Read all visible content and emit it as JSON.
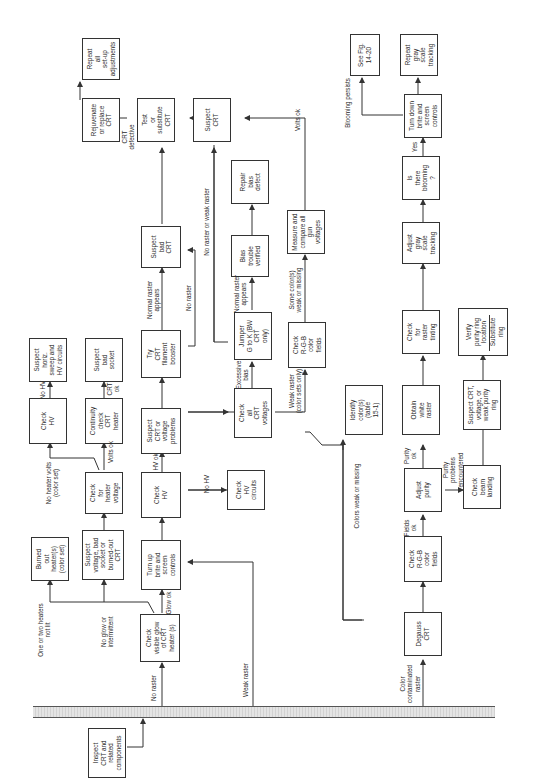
{
  "diagram": {
    "orientation": "rotated 90 degrees counter-clockwise",
    "start": {
      "id": "inspect",
      "label": "Inspect\nCRT and\nrelated\ncomponents"
    },
    "boxes": [
      {
        "id": "inspect",
        "label": "Inspect\nCRT and\nrelated\ncomponents"
      },
      {
        "id": "check_glow",
        "label": "Check\nvisible glow\nof CRT\nheater (s)"
      },
      {
        "id": "burned_out",
        "label": "Burned\nout\nheater(s)\n(color set)"
      },
      {
        "id": "suspect_voltage",
        "label": "Suspect\nvoltage, bad\nsocket or\nburned-out\nCRT"
      },
      {
        "id": "turn_up",
        "label": "Turn up\nbrite and\nscreen\ncontrols"
      },
      {
        "id": "check_heater_voltage",
        "label": "Check\nfor\nheater\nvoltage"
      },
      {
        "id": "check_hv_1",
        "label": "Check\nHV"
      },
      {
        "id": "suspect_horiz",
        "label": "Suspect\nhoriz.\nsweep and\nHV circuits"
      },
      {
        "id": "continuity",
        "label": "Continuity\ncheck\nCRT\nheater"
      },
      {
        "id": "suspect_socket",
        "label": "Suspect\nbad\nsocket"
      },
      {
        "id": "check_hv_2",
        "label": "Check\nHV"
      },
      {
        "id": "check_hv_circuits",
        "label": "Check\nHV\ncircuits"
      },
      {
        "id": "suspect_crt_voltage",
        "label": "Suspect\nCRT or\nvoltage\nproblems"
      },
      {
        "id": "try_booster",
        "label": "Try\nCRT\nfilament\nbooster"
      },
      {
        "id": "suspect_bad_crt",
        "label": "Suspect\nbad\nCRT"
      },
      {
        "id": "test_substitute",
        "label": "Test\nor\nsubstitute\nCRT"
      },
      {
        "id": "rejuvenate",
        "label": "Rejuvenate\nor replace\nCRT"
      },
      {
        "id": "repeat_setup",
        "label": "Repeat\nall\nset-up\nadjustments"
      },
      {
        "id": "check_all_crt",
        "label": "Check\nall\nCRT\nvoltages"
      },
      {
        "id": "jumper",
        "label": "Jumper\nG to K (BW\nCRT\nonly)"
      },
      {
        "id": "bias_verified",
        "label": "Bias\ntrouble\nverified"
      },
      {
        "id": "repair_bias",
        "label": "Repair\nbias\ndefect"
      },
      {
        "id": "check_rgb_1",
        "label": "Check\nR-G-B\ncolor\nfields"
      },
      {
        "id": "measure_gun",
        "label": "Measure and\ncompare all\ngun\nvoltages"
      },
      {
        "id": "suspect_crt",
        "label": "Suspect\nCRT"
      },
      {
        "id": "degauss",
        "label": "Degauss\nCRT"
      },
      {
        "id": "check_rgb_2",
        "label": "Check\nR-G-B\ncolor\nfields"
      },
      {
        "id": "identify_colors",
        "label": "Identify\ncolor(s)\n(table\n15-1)"
      },
      {
        "id": "adjust_purity",
        "label": "Adjust\npurity"
      },
      {
        "id": "obtain_white",
        "label": "Obtain\nwhite\nraster"
      },
      {
        "id": "check_tinting",
        "label": "Check\nfor\nraster\ntinting"
      },
      {
        "id": "adjust_gray",
        "label": "Adjust\ngray\nscale\ntracking"
      },
      {
        "id": "is_blooming",
        "label": "Is\nthere\nblooming\n?"
      },
      {
        "id": "turn_down",
        "label": "Turn down\nbrite and\nscreen\ncontrols"
      },
      {
        "id": "see_fig",
        "label": "See Fig.\n14-20"
      },
      {
        "id": "repeat_gray",
        "label": "Repeat\ngray\nscale\ntracking"
      },
      {
        "id": "check_beam",
        "label": "Check\nbeam\nlanding"
      },
      {
        "id": "suspect_purity_ring",
        "label": "Suspect CRT,\nvoltage, or\nweak purity\nring"
      },
      {
        "id": "verify_ring",
        "label": "Verify\npurity ring\nlocation"
      },
      {
        "id": "substitute_ring",
        "label": "Substitute\nring"
      }
    ],
    "labels": {
      "no_raster": "No raster",
      "weak_raster": "Weak raster",
      "color_contaminated": "Color\ncontaminated\nraster",
      "one_or_two": "One or two heaters\nnot lit",
      "no_glow": "No glow or\nintermittent",
      "glow_ok": "Glow ok",
      "no_heater_volts": "No heater volts\n(color set)",
      "volts_ok_1": "Volts ok",
      "no_hv_1": "No HV",
      "crt_ok": "CRT\nok",
      "hv_ok": "HV ok",
      "no_hv_2": "No HV",
      "normal_raster_1": "Normal raster\nappears",
      "no_raster_2": "No raster",
      "crt_defective": "CRT\ndefective",
      "no_raster_or_weak": "No raster or weak raster",
      "excessive_bias": "Excessive\nbias",
      "normal_raster_2": "Normal raster\nappears",
      "weak_raster_color": "Weak raster\n(color sets only)",
      "some_colors": "Some color(s)\nweak or missing",
      "volts_ok_2": "Volts ok",
      "colors_weak": "Colors weak or missing",
      "fields_ok": "Fields\nok",
      "purity_ok": "Purity\nok",
      "purity_problems": "Purity\nproblems\nencountered",
      "yes": "Yes",
      "blooming_persists": "Blooming persists"
    }
  }
}
